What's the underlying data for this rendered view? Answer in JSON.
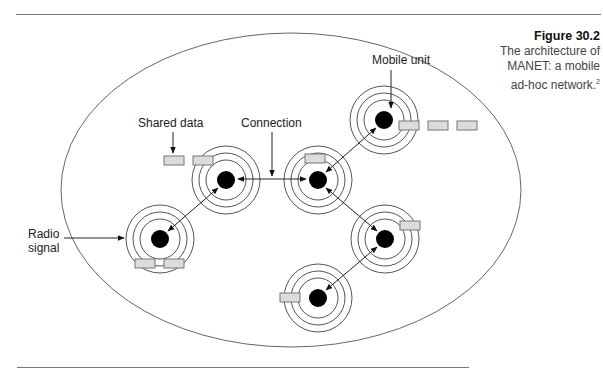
{
  "caption": {
    "figure_number": "Figure 30.2",
    "line1": "The architecture of",
    "line2": "MANET: a mobile",
    "line3": "ad-hoc network.",
    "footnote_marker": "2"
  },
  "labels": {
    "mobile_unit": "Mobile unit",
    "shared_data": "Shared data",
    "connection": "Connection",
    "radio_line1": "Radio",
    "radio_line2": "signal"
  },
  "colors": {
    "line": "#555555",
    "node": "#000000",
    "data_box_fill": "#dcdcdc",
    "data_box_stroke": "#777777",
    "rule": "#777777"
  },
  "diagram": {
    "boundary_ellipse": {
      "cx": 291,
      "cy": 190,
      "rx": 230,
      "ry": 157
    },
    "nodes": [
      {
        "id": "A",
        "x": 226,
        "y": 180
      },
      {
        "id": "B",
        "x": 318,
        "y": 180
      },
      {
        "id": "C",
        "x": 384,
        "y": 148
      },
      {
        "id": "D",
        "x": 160,
        "y": 239
      },
      {
        "id": "E",
        "x": 385,
        "y": 239
      },
      {
        "id": "F",
        "x": 318,
        "y": 298
      }
    ],
    "connections": [
      [
        "A",
        "B"
      ],
      [
        "A",
        "D"
      ],
      [
        "B",
        "C"
      ],
      [
        "B",
        "E"
      ],
      [
        "E",
        "F"
      ]
    ]
  }
}
